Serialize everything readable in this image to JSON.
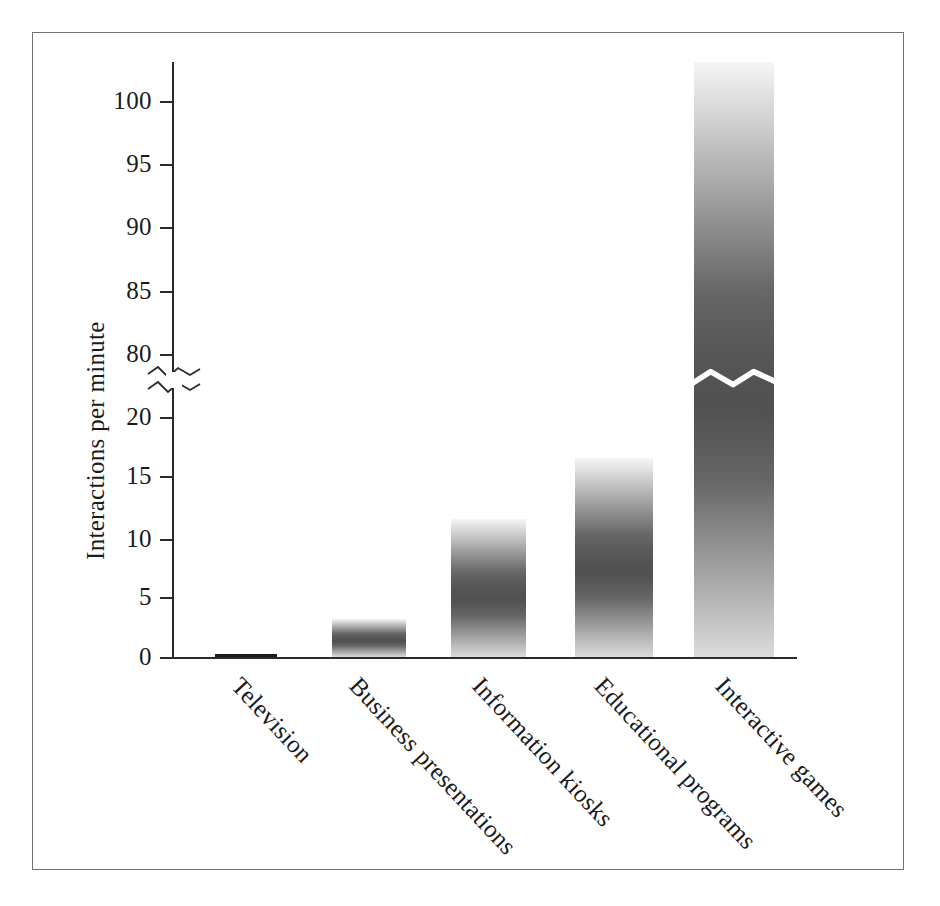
{
  "chart_data": {
    "type": "bar",
    "title": "",
    "subtitle": "",
    "xlabel": "",
    "ylabel": "Interactions per minute",
    "categories": [
      "Television",
      "Business presentations",
      "Information kiosks",
      "Educational programs",
      "Interactive games"
    ],
    "values": [
      0.1,
      3,
      10,
      15,
      102
    ],
    "ylim": [
      0,
      102
    ],
    "y_ticks": [
      0,
      5,
      10,
      15,
      20,
      80,
      85,
      90,
      95,
      100
    ],
    "y_tick_labels": [
      "0",
      "5",
      "10",
      "15",
      "20",
      "80",
      "85",
      "90",
      "95",
      "100"
    ],
    "axis_break": {
      "present": true,
      "between": [
        20,
        80
      ],
      "style": "zigzag",
      "crosses_bar": "Interactive games"
    },
    "grid": false,
    "legend": null,
    "bar_color": "#121212",
    "axis_color": "#2b2b2b"
  },
  "axis": {
    "y_title": "Interactions per minute",
    "ticks": [
      {
        "label": "100",
        "value": 100,
        "y": 102
      },
      {
        "label": "95",
        "value": 95,
        "y": 165
      },
      {
        "label": "90",
        "value": 90,
        "y": 228
      },
      {
        "label": "85",
        "value": 85,
        "y": 292
      },
      {
        "label": "80",
        "value": 80,
        "y": 355
      },
      {
        "label": "20",
        "value": 20,
        "y": 418
      },
      {
        "label": "15",
        "value": 15,
        "y": 477
      },
      {
        "label": "10",
        "value": 10,
        "y": 540
      },
      {
        "label": "5",
        "value": 5,
        "y": 598
      },
      {
        "label": "0",
        "value": 0,
        "y": 658
      }
    ]
  },
  "bars": [
    {
      "label": "Television",
      "value": 0.1,
      "x": 215,
      "width": 62,
      "top": 654,
      "bottom": 657
    },
    {
      "label": "Business presentations",
      "value": 3,
      "x": 332,
      "width": 74,
      "top": 619,
      "bottom": 657
    },
    {
      "label": "Information kiosks",
      "value": 10,
      "x": 451,
      "width": 75,
      "top": 519,
      "bottom": 657
    },
    {
      "label": "Educational programs",
      "value": 15,
      "x": 575,
      "width": 78,
      "top": 458,
      "bottom": 657
    },
    {
      "label": "Interactive games",
      "value": 102,
      "x": 694,
      "width": 80,
      "top": 62,
      "bottom": 657
    }
  ],
  "category_label_anchors": [
    {
      "label": "Television",
      "x": 246,
      "y": 672
    },
    {
      "label": "Business presentations",
      "x": 364,
      "y": 672
    },
    {
      "label": "Information kiosks",
      "x": 487,
      "y": 672
    },
    {
      "label": "Educational programs",
      "x": 609,
      "y": 672
    },
    {
      "label": "Interactive games",
      "x": 730,
      "y": 672
    }
  ],
  "colors": {
    "bar": "#121212",
    "axis": "#2b2b2b",
    "text": "#1b1b1b",
    "frame": "#6f7276",
    "background": "#ffffff",
    "break_line": "#ffffff"
  }
}
